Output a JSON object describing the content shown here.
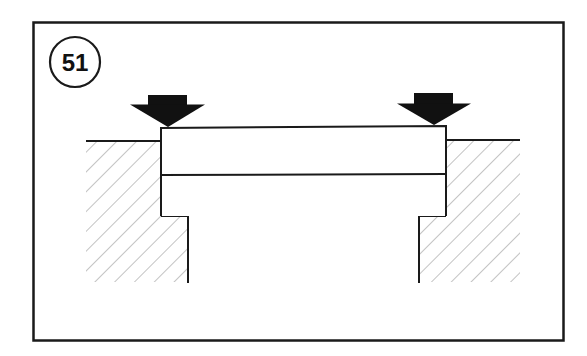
{
  "figure": {
    "step_number": "51",
    "colors": {
      "line": "#1a1a1a",
      "hatch": "#9a9a9a",
      "arrow": "#111111",
      "background": "#ffffff"
    },
    "elements": {
      "arrows": [
        {
          "name": "left-press-arrow",
          "direction": "down"
        },
        {
          "name": "right-press-arrow",
          "direction": "down"
        }
      ],
      "hatched_regions": [
        "left-housing",
        "right-housing"
      ],
      "block": "stepped-component"
    }
  }
}
